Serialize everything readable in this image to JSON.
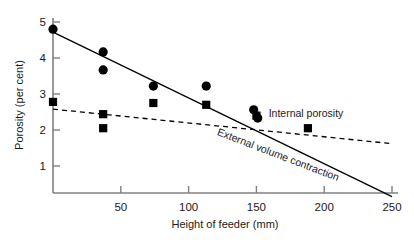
{
  "chart_data": {
    "type": "scatter",
    "title": "",
    "xlabel": "Height of feeder (mm)",
    "ylabel": "Porosity (per cent)",
    "xlim": [
      0,
      250
    ],
    "ylim": [
      0,
      5
    ],
    "xticks": [
      50,
      100,
      150,
      200,
      250
    ],
    "yticks": [
      1,
      2,
      3,
      4,
      5
    ],
    "xtick_labels": [
      "50",
      "100",
      "150",
      "200",
      "250"
    ],
    "ytick_labels": [
      "1",
      "2",
      "3",
      "4",
      "5"
    ],
    "grid": false,
    "legend_position": "inline-annotation",
    "series": [
      {
        "name": "External volume contraction",
        "marker": "circle",
        "line_style": "solid",
        "label_text": "External volume contraction",
        "points": [
          {
            "x": 0,
            "y": 4.8
          },
          {
            "x": 37,
            "y": 4.17
          },
          {
            "x": 37,
            "y": 3.67
          },
          {
            "x": 74,
            "y": 3.22
          },
          {
            "x": 113,
            "y": 3.22
          },
          {
            "x": 148,
            "y": 2.56
          },
          {
            "x": 151,
            "y": 2.33
          }
        ],
        "fit_line": {
          "x0": 0,
          "y0": 4.72,
          "x1": 250,
          "y1": 0.15
        }
      },
      {
        "name": "Internal porosity",
        "marker": "square",
        "line_style": "dashed",
        "label_text": "Internal porosity",
        "points": [
          {
            "x": 0,
            "y": 2.78
          },
          {
            "x": 37,
            "y": 2.44
          },
          {
            "x": 37,
            "y": 2.05
          },
          {
            "x": 74,
            "y": 2.75
          },
          {
            "x": 113,
            "y": 2.7
          },
          {
            "x": 150,
            "y": 2.4
          },
          {
            "x": 188,
            "y": 2.05
          }
        ],
        "fit_line": {
          "x0": 0,
          "y0": 2.58,
          "x1": 250,
          "y1": 1.62
        }
      }
    ]
  },
  "annotations": {
    "internal_porosity_label": "Internal porosity",
    "external_volume_contraction_label": "External volume contraction"
  },
  "axes": {
    "x_title": "Height of feeder (mm)",
    "y_title": "Porosity (per cent)"
  },
  "colors": {
    "axis": "#808080",
    "marker": "#000000",
    "text": "#1a1a1a",
    "background": "#ffffff"
  }
}
